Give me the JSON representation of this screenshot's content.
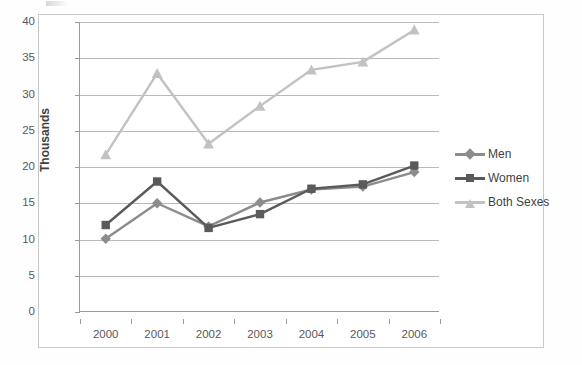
{
  "chart_data": {
    "type": "line",
    "title": "",
    "xlabel": "",
    "ylabel": "Thousands",
    "categories": [
      "2000",
      "2001",
      "2002",
      "2003",
      "2004",
      "2005",
      "2006"
    ],
    "ylim": [
      0,
      40
    ],
    "yticks": [
      0,
      5,
      10,
      15,
      20,
      25,
      30,
      35,
      40
    ],
    "grid": true,
    "legend_position": "right",
    "series": [
      {
        "name": "Men",
        "color": "#8c8c8c",
        "marker": "diamond",
        "values": [
          10.1,
          15.0,
          11.8,
          15.1,
          16.9,
          17.3,
          19.3
        ]
      },
      {
        "name": "Women",
        "color": "#5a5a5a",
        "marker": "square",
        "values": [
          12.0,
          18.0,
          11.6,
          13.5,
          17.0,
          17.6,
          20.2
        ]
      },
      {
        "name": "Both Sexes",
        "color": "#c2c2c2",
        "marker": "triangle",
        "values": [
          21.7,
          32.9,
          23.2,
          28.4,
          33.4,
          34.5,
          38.9
        ]
      }
    ]
  },
  "axis": {
    "y_title": "Thousands",
    "y_tick_labels": [
      "40",
      "35",
      "30",
      "25",
      "20",
      "15",
      "10",
      "5",
      "0"
    ],
    "x_tick_labels": [
      "2000",
      "2001",
      "2002",
      "2003",
      "2004",
      "2005",
      "2006"
    ]
  },
  "legend": {
    "items": [
      {
        "label": "Men",
        "color": "#8c8c8c",
        "marker": "diamond"
      },
      {
        "label": "Women",
        "color": "#5a5a5a",
        "marker": "square"
      },
      {
        "label": "Both Sexes",
        "color": "#c2c2c2",
        "marker": "triangle"
      }
    ]
  }
}
